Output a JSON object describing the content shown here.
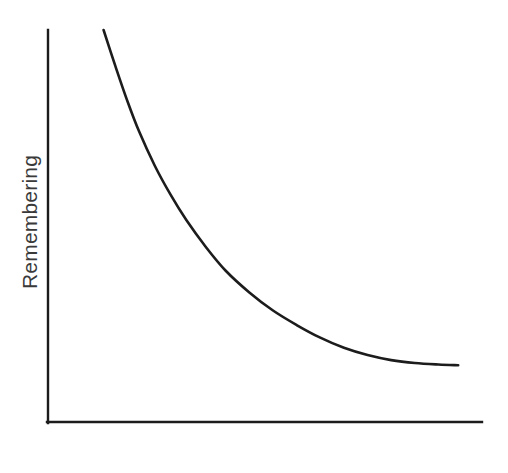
{
  "chart_data": {
    "type": "line",
    "title": "",
    "subtitle": "",
    "xlabel": "Time",
    "ylabel": "Remembering",
    "grid": false,
    "legend": null,
    "legend_position": "none",
    "xlim": [
      0,
      100
    ],
    "ylim": [
      0,
      100
    ],
    "xticks": [],
    "yticks": [],
    "xtick_labels": [],
    "ytick_labels": [],
    "series": [
      {
        "name": "Remembering",
        "color": "#1c1c1c",
        "line_width": 2.6,
        "x": [
          7,
          10,
          13,
          16,
          20,
          24,
          28,
          33,
          38,
          44,
          50,
          56,
          62,
          68,
          74,
          80,
          86,
          92,
          97
        ],
        "y": [
          100,
          90,
          80.5,
          72,
          62.5,
          54.5,
          47.5,
          40,
          33.5,
          27.5,
          22.5,
          18.5,
          15,
          12.2,
          10.2,
          8.8,
          8.0,
          7.6,
          7.4
        ]
      }
    ],
    "annotations": [],
    "colors": {
      "background": "#ffffff",
      "axis": "#1c1c1c",
      "curve": "#1c1c1c",
      "label_text": "#3a3a3a"
    },
    "axes_geometry": {
      "origin_x": 47,
      "origin_y": 423,
      "y_axis_top": 30,
      "x_axis_right": 482
    }
  }
}
